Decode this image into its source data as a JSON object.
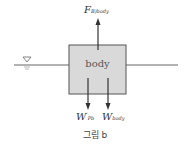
{
  "diagram": {
    "body_label": "body",
    "forces": {
      "buoyancy": {
        "main": "F",
        "sub": "B)body"
      },
      "weight_fluid": {
        "main": "W",
        "prime": "′",
        "sub": "Pb"
      },
      "weight_body": {
        "main": "W",
        "sub": "body"
      }
    },
    "free_surface_symbol": "▽",
    "caption": "그림 b",
    "colors": {
      "box_fill": "#d9d9d9",
      "box_stroke": "#555555",
      "water_line": "#9a9a9a",
      "arrow": "#333333"
    }
  }
}
